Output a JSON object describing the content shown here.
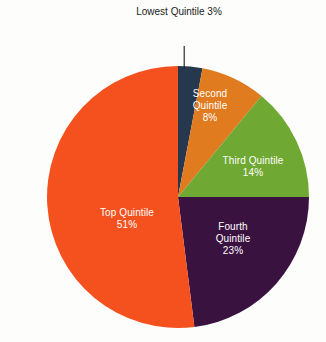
{
  "chart_data": {
    "type": "pie",
    "title": "",
    "subtitle": "",
    "xlabel": "",
    "ylabel": "",
    "legend_position": "none",
    "grid": false,
    "units": "percent",
    "categories": [
      "Lowest Quintile",
      "Second Quintile",
      "Third Quintile",
      "Fourth Quintile",
      "Top Quintile"
    ],
    "values": [
      3,
      8,
      14,
      23,
      51
    ],
    "value_labels": [
      "3%",
      "8%",
      "14%",
      "23%",
      "51%"
    ],
    "colors": [
      "#26384d",
      "#e07b20",
      "#6fa832",
      "#3a1240",
      "#f4511e"
    ],
    "slices": [
      {
        "name": "Lowest Quintile",
        "label_line1": "Lowest",
        "label_line2": "Quintile",
        "value": 3,
        "value_label": "3%",
        "color": "#26384d",
        "label_placement": "outside-callout",
        "label_color": "#1a1a1a",
        "start_angle_deg": 0,
        "end_angle_deg": 10.8
      },
      {
        "name": "Second Quintile",
        "label_line1": "Second",
        "label_line2": "Quintile",
        "value": 8,
        "value_label": "8%",
        "color": "#e07b20",
        "label_placement": "inside",
        "label_color": "#ffffff",
        "start_angle_deg": 10.8,
        "end_angle_deg": 39.6
      },
      {
        "name": "Third Quintile",
        "label_line1": "Third Quintile",
        "label_line2": "",
        "value": 14,
        "value_label": "14%",
        "color": "#6fa832",
        "label_placement": "inside",
        "label_color": "#ffffff",
        "start_angle_deg": 39.6,
        "end_angle_deg": 90.0
      },
      {
        "name": "Fourth Quintile",
        "label_line1": "Fourth",
        "label_line2": "Quintile",
        "value": 23,
        "value_label": "23%",
        "color": "#3a1240",
        "label_placement": "inside",
        "label_color": "#ffffff",
        "start_angle_deg": 90.0,
        "end_angle_deg": 172.8
      },
      {
        "name": "Top Quintile",
        "label_line1": "Top Quintile",
        "label_line2": "",
        "value": 51,
        "value_label": "51%",
        "color": "#f4511e",
        "label_placement": "inside",
        "label_color": "#ffffff",
        "start_angle_deg": 172.8,
        "end_angle_deg": 360.0
      }
    ],
    "geometry": {
      "center_x": 178,
      "center_y": 197,
      "radius": 131,
      "callout_line_color": "#1a1a1a"
    },
    "background_color": "#fdfdfc"
  }
}
